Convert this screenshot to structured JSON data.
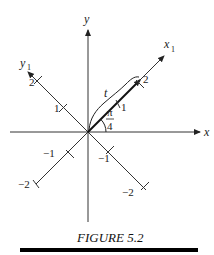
{
  "figure": {
    "caption": "FIGURE 5.2",
    "axes": {
      "x_label": "x",
      "y_label": "y",
      "x1_label": "x",
      "x1_sub": "1",
      "y1_label": "y",
      "y1_sub": "1"
    },
    "rotated_ticks": {
      "x1_pos": [
        "1",
        "2"
      ],
      "x1_neg": [
        "−1",
        "−2"
      ],
      "y1_pos": [
        "1",
        "2"
      ],
      "y1_neg": [
        "−1",
        "−2"
      ]
    },
    "angle_label": {
      "numerator": "π",
      "denominator": "4"
    },
    "curve_label": "t",
    "colors": {
      "line": "#222222",
      "caption_bar": "#000000"
    }
  }
}
